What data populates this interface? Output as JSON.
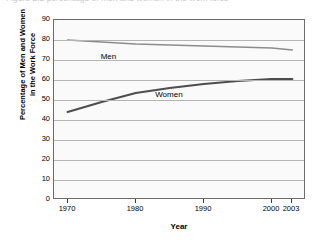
{
  "caption": {
    "text": "Figure 2.1  percentage of men and women in the work force"
  },
  "chart_data": {
    "type": "line",
    "title": "",
    "xlabel": "Year",
    "ylabel": "Percentage of Men and Women in the Work Force",
    "ylabel_line1": "Percentage of Men and Women",
    "ylabel_line2": "in the Work Force",
    "xlim": [
      1968,
      2005
    ],
    "ylim": [
      0,
      90
    ],
    "ytick_values": [
      90,
      80,
      70,
      60,
      50,
      40,
      30,
      20,
      10,
      0
    ],
    "ytick_labels": [
      "90",
      "80",
      "70",
      "60",
      "50",
      "40",
      "30",
      "20",
      "10",
      "0"
    ],
    "xtick_values": [
      1970,
      1980,
      1990,
      2000,
      2003
    ],
    "xtick_labels": [
      "1970",
      "1980",
      "1990",
      "2000",
      "2003"
    ],
    "grid": true,
    "grid_axis": "y",
    "legend": "inline-labels",
    "series": [
      {
        "name": "Men",
        "color": "#8c8c8c",
        "label_x": 1975,
        "label_y": 71,
        "x": [
          1970,
          1975,
          1980,
          1985,
          1990,
          1995,
          2000,
          2003
        ],
        "values": [
          80,
          79,
          78,
          77.5,
          77,
          76.5,
          76,
          75
        ]
      },
      {
        "name": "Women",
        "color": "#4d4d4d",
        "label_x": 1983,
        "label_y": 52,
        "x": [
          1970,
          1975,
          1980,
          1985,
          1990,
          1995,
          2000,
          2003
        ],
        "values": [
          44,
          49,
          53.5,
          56,
          58,
          59.5,
          60.5,
          60.5
        ]
      }
    ]
  },
  "axis": {
    "y_label_line1": "Percentage of Men and Women",
    "y_label_line2": "in the Work Force",
    "x_label": "Year"
  },
  "labels": {
    "men": "Men",
    "women": "Women"
  },
  "ticks": {
    "y": [
      "90",
      "80",
      "70",
      "60",
      "50",
      "40",
      "30",
      "20",
      "10",
      "0"
    ],
    "x": [
      "1970",
      "1980",
      "1990",
      "2000",
      "2003"
    ]
  },
  "colors": {
    "men_line": "#8c8c8c",
    "women_line": "#4d4d4d",
    "grid": "#b4b4b4",
    "frame": "#6b6b6b",
    "plot_background": "#fafafa"
  }
}
